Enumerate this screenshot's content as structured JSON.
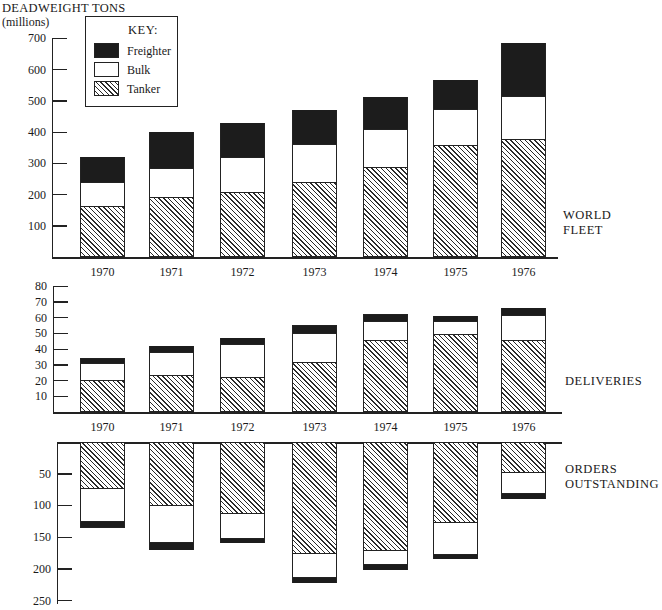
{
  "figure": {
    "y_title": "DEADWEIGHT TONS",
    "y_subtitle": "(millions)",
    "key": {
      "title": "KEY:",
      "items": [
        {
          "name": "Freighter",
          "pattern": "solid-black",
          "color": "#1c1c1c"
        },
        {
          "name": "Bulk",
          "pattern": "white",
          "color": "#ffffff"
        },
        {
          "name": "Tanker",
          "pattern": "diagonal-hatch",
          "color": "#2a2a2a"
        }
      ]
    },
    "panels": {
      "world_fleet": {
        "label_line1": "WORLD",
        "label_line2": "FLEET"
      },
      "deliveries": {
        "label": "DELIVERIES"
      },
      "orders": {
        "label_line1": "ORDERS",
        "label_line2": "OUTSTANDING"
      }
    }
  },
  "chart_data": [
    {
      "type": "bar",
      "stacked": true,
      "title": "WORLD FLEET",
      "xlabel": "",
      "ylabel": "DEADWEIGHT TONS (millions)",
      "categories": [
        "1970",
        "1971",
        "1972",
        "1973",
        "1974",
        "1975",
        "1976"
      ],
      "yticks": [
        "100",
        "200",
        "300",
        "400",
        "500",
        "600",
        "700"
      ],
      "ylim": [
        0,
        700
      ],
      "series": [
        {
          "name": "Tanker",
          "values": [
            160,
            190,
            207,
            239,
            284,
            355,
            374
          ]
        },
        {
          "name": "Bulk",
          "values": [
            82,
            97,
            113,
            122,
            126,
            119,
            142
          ]
        },
        {
          "name": "Freighter",
          "values": [
            78,
            113,
            108,
            109,
            103,
            94,
            168
          ]
        }
      ],
      "totals": [
        320,
        400,
        428,
        470,
        513,
        568,
        684
      ],
      "legend_position": "top-left",
      "grid": false
    },
    {
      "type": "bar",
      "stacked": true,
      "title": "DELIVERIES",
      "xlabel": "",
      "ylabel": "DEADWEIGHT TONS (millions)",
      "categories": [
        "1970",
        "1971",
        "1972",
        "1973",
        "1974",
        "1975",
        "1976"
      ],
      "yticks": [
        "10",
        "20",
        "30",
        "40",
        "50",
        "60",
        "70",
        "80"
      ],
      "ylim": [
        0,
        80
      ],
      "series": [
        {
          "name": "Tanker",
          "values": [
            20,
            23,
            22,
            31,
            45,
            49,
            45
          ]
        },
        {
          "name": "Bulk",
          "values": [
            11,
            15,
            21,
            19,
            13,
            9,
            17
          ]
        },
        {
          "name": "Freighter",
          "values": [
            3,
            4,
            4,
            5,
            4,
            3,
            4
          ]
        }
      ],
      "totals": [
        34,
        42,
        47,
        55,
        62,
        61,
        66
      ],
      "grid": false
    },
    {
      "type": "bar",
      "stacked": true,
      "orientation": "downward",
      "title": "ORDERS OUTSTANDING",
      "xlabel": "",
      "ylabel": "DEADWEIGHT TONS (millions)",
      "categories": [
        "1970",
        "1971",
        "1972",
        "1973",
        "1974",
        "1975",
        "1976"
      ],
      "yticks": [
        "50",
        "100",
        "150",
        "200",
        "250"
      ],
      "ylim": [
        0,
        250
      ],
      "series": [
        {
          "name": "Tanker",
          "values": [
            73,
            100,
            113,
            175,
            170,
            127,
            48
          ]
        },
        {
          "name": "Bulk",
          "values": [
            54,
            60,
            40,
            40,
            25,
            51,
            34
          ]
        },
        {
          "name": "Freighter",
          "values": [
            8,
            10,
            7,
            7,
            7,
            7,
            8
          ]
        }
      ],
      "totals": [
        135,
        170,
        160,
        222,
        202,
        185,
        90
      ],
      "grid": false
    }
  ]
}
